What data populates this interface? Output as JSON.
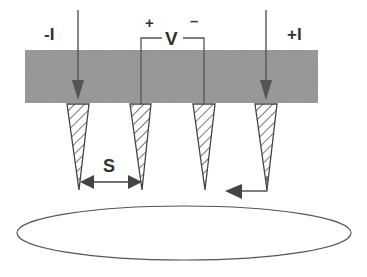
{
  "diagram": {
    "labels": {
      "current_in": "-I",
      "current_out": "+I",
      "voltage": "V",
      "voltage_plus": "+",
      "voltage_minus": "–",
      "spacing": "S"
    },
    "components": {
      "probe_holder": "probe-holder-block",
      "probes": [
        "probe-1",
        "probe-2",
        "probe-3",
        "probe-4"
      ],
      "sample": "sample-ellipse"
    },
    "colors": {
      "holder_fill": "#9a9a9a",
      "line": "#555555",
      "arrow": "#444444",
      "text": "#333333",
      "background": "#ffffff"
    }
  }
}
